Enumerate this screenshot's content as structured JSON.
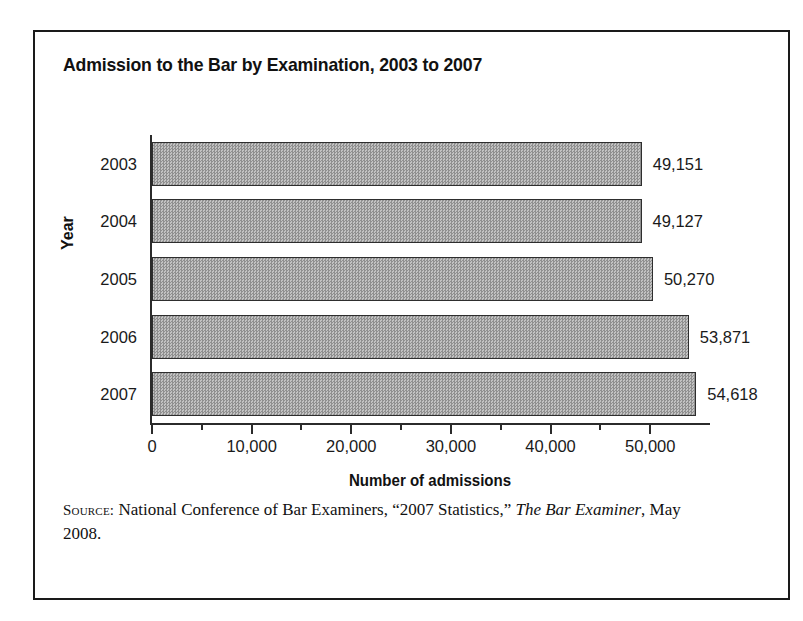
{
  "chart_data": {
    "type": "bar",
    "orientation": "horizontal",
    "title": "Admission to the Bar by Examination, 2003 to 2007",
    "xlabel": "Number of admissions",
    "ylabel": "Year",
    "categories": [
      "2003",
      "2004",
      "2005",
      "2006",
      "2007"
    ],
    "values": [
      49151,
      49127,
      50270,
      53871,
      54618
    ],
    "value_labels": [
      "49,151",
      "49,127",
      "50,270",
      "53,871",
      "54,618"
    ],
    "xlim": [
      0,
      56000
    ],
    "xticks": [
      0,
      10000,
      20000,
      30000,
      40000,
      50000
    ],
    "xtick_labels": [
      "0",
      "10,000",
      "20,000",
      "30,000",
      "40,000",
      "50,000"
    ],
    "minor_xticks": [
      5000,
      15000,
      25000,
      35000,
      45000
    ],
    "grid": false,
    "legend": false,
    "bar_color": "#a9a9a9",
    "bar_edge_color": "#2e2e2e",
    "axis_color": "#2b2b2b"
  },
  "source": {
    "label": "Source:",
    "text_before_italic": " National Conference of Bar Examiners, “2007 Statistics,” ",
    "italic_text": "The Bar Examiner",
    "text_after_italic": ", May 2008."
  }
}
